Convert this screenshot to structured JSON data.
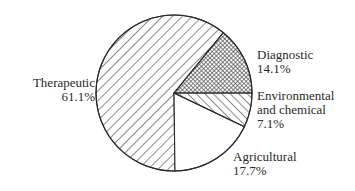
{
  "chart_data": {
    "type": "pie",
    "title": "",
    "start_angle_deg": 0,
    "direction": "counterclockwise",
    "slices": [
      {
        "name": "Diagnostic",
        "value": 14.1,
        "label": "14.1%",
        "pattern": "crosshatch"
      },
      {
        "name": "Therapeutic",
        "value": 61.1,
        "label": "61.1%",
        "pattern": "diagonal-backslash"
      },
      {
        "name": "Agricultural",
        "value": 17.7,
        "label": "17.7%",
        "pattern": "none"
      },
      {
        "name": "Environmental and chemical",
        "value": 7.1,
        "label": "7.1%",
        "pattern": "diagonal-slash"
      }
    ],
    "categories": [
      "Diagnostic",
      "Therapeutic",
      "Agricultural",
      "Environmental and chemical"
    ],
    "values": [
      14.1,
      61.1,
      17.7,
      7.1
    ],
    "legend": "none (direct labels)"
  },
  "labels": {
    "therapeutic": {
      "line1": "Therapeutic",
      "line2": "61.1%"
    },
    "diagnostic": {
      "line1": "Diagnostic",
      "line2": "14.1%"
    },
    "environmental": {
      "line1": "Environmental",
      "line2": "and chemical",
      "line3": "7.1%"
    },
    "agricultural": {
      "line1": "Agricultural",
      "line2": "17.7%"
    }
  },
  "colors": {
    "stroke": "#2a2a2a",
    "background": "#ffffff"
  }
}
